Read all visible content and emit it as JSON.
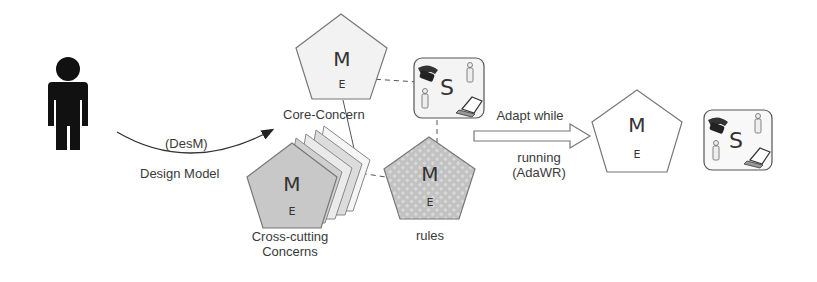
{
  "diagram": {
    "actor": {
      "icon": "person-icon"
    },
    "design_arrow": {
      "label_top": "(DesM)",
      "label_bottom": "Design Model"
    },
    "core_concern": {
      "m": "M",
      "e": "E",
      "label": "Core-Concern",
      "fill": "#f0f0f0"
    },
    "cross_cutting": {
      "m": "M",
      "e": "E",
      "label_line1": "Cross-cutting",
      "label_line2": "Concerns",
      "fill": "#c8c8c8"
    },
    "rules": {
      "m": "M",
      "e": "E",
      "label": "rules",
      "fill": "#c4c4c4"
    },
    "system_box": {
      "s": "S",
      "icons": [
        "telephone-icon",
        "person-icon",
        "person-icon",
        "laptop-icon"
      ]
    },
    "adapt_arrow": {
      "label_top": "Adapt while",
      "label_bottom_1": "running",
      "label_bottom_2": "(AdaWR)"
    },
    "result_model": {
      "m": "M",
      "e": "E",
      "fill": "#ffffff"
    },
    "result_system": {
      "s": "S"
    }
  }
}
